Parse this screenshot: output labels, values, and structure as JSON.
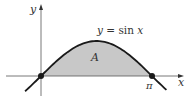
{
  "figure": {
    "function": "sin",
    "domain_shown": [
      -0.45,
      3.55
    ],
    "shaded_interval": [
      0,
      3.14159
    ],
    "marked_points": [
      {
        "name": "origin",
        "x": 0,
        "y": 0
      },
      {
        "name": "pi",
        "x": 3.14159,
        "y": 0
      }
    ],
    "colors": {
      "curve": "#1a1a1a",
      "fill": "#c8c8c8",
      "axis": "#555555",
      "point": "#1a1a1a"
    }
  },
  "labels": {
    "y_axis": "y",
    "x_axis": "x",
    "equation": "y = sin x",
    "equation_var": "y",
    "equation_eq": " = sin ",
    "equation_x": "x",
    "region": "A",
    "pi_tick": "π"
  }
}
